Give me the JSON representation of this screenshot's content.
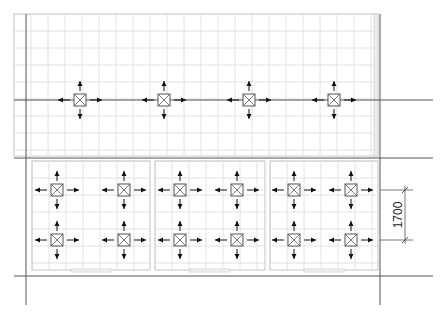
{
  "drawing": {
    "type": "floor-plan-hvac-diffuser-layout",
    "colors": {
      "background": "#ffffff",
      "grid": "#e2e2e2",
      "wall": "#cfcfcf",
      "axis": "#555555",
      "fixture": "#555555",
      "arrow": "#111111",
      "dimension": "#555555",
      "text": "#222222"
    },
    "grid_spacing_px": 17,
    "axis_lines": {
      "vertical_x": [
        26,
        380
      ],
      "horizontal_y": [
        158,
        276
      ],
      "upper_duct_y": 100
    },
    "upper_zone": {
      "x": 14,
      "y": 14,
      "w": 364,
      "h": 142,
      "fixture_row_y": 100,
      "fixtures_x": [
        80,
        164,
        249,
        334
      ]
    },
    "lower_rooms": [
      {
        "x": 32,
        "y": 161,
        "w": 118,
        "h": 109
      },
      {
        "x": 155,
        "y": 161,
        "w": 110,
        "h": 109
      },
      {
        "x": 270,
        "y": 161,
        "w": 108,
        "h": 109
      }
    ],
    "lower_fixtures": {
      "rows_y": [
        190,
        240
      ],
      "cols_x": [
        57,
        124,
        180,
        237,
        294,
        351
      ]
    },
    "dimension": {
      "label": "1700",
      "x": 405,
      "y_start": 190,
      "y_end": 240,
      "orientation": "vertical"
    },
    "fixture_icon": "square-diffuser-icon",
    "arrow_icon": "airflow-arrow-icon"
  }
}
